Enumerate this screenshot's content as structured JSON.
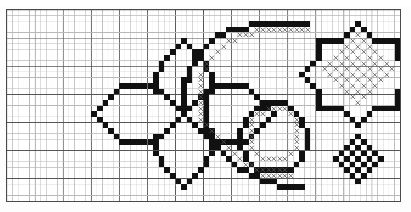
{
  "document": {
    "kind": "cross-stitch-pattern-chart",
    "title": "Cross-stitch pattern chart",
    "description": "Graph-paper needlework chart with three ornamental motifs"
  },
  "grid": {
    "origin_x": 6,
    "origin_y": 9,
    "cell_size": 5.62,
    "columns": 70,
    "rows": 34,
    "minor_line_color": "#b8b8b8",
    "major_line_color": "#555555",
    "major_every": 5,
    "border_color": "#4a4a4a",
    "background_color": "#ffffff"
  },
  "symbols": {
    "filled": {
      "name": "filled-square",
      "color": "#111111"
    },
    "cross": {
      "name": "cross-stitch-x",
      "color": "#555555"
    }
  },
  "motifs": [
    {
      "name": "four-petal-flower",
      "label": "Four petal flower motif",
      "filled": [
        [
          31,
          5
        ],
        [
          30,
          6
        ],
        [
          32,
          6
        ],
        [
          29,
          7
        ],
        [
          33,
          7
        ],
        [
          28,
          8
        ],
        [
          34,
          8
        ],
        [
          27,
          9
        ],
        [
          35,
          9
        ],
        [
          27,
          10
        ],
        [
          35,
          10
        ],
        [
          26,
          11
        ],
        [
          36,
          11
        ],
        [
          26,
          12
        ],
        [
          36,
          12
        ],
        [
          20,
          13
        ],
        [
          21,
          13
        ],
        [
          22,
          13
        ],
        [
          23,
          13
        ],
        [
          24,
          13
        ],
        [
          25,
          13
        ],
        [
          26,
          13
        ],
        [
          36,
          13
        ],
        [
          37,
          13
        ],
        [
          38,
          13
        ],
        [
          39,
          13
        ],
        [
          40,
          13
        ],
        [
          41,
          13
        ],
        [
          42,
          13
        ],
        [
          19,
          14
        ],
        [
          26,
          14
        ],
        [
          27,
          14
        ],
        [
          35,
          14
        ],
        [
          36,
          14
        ],
        [
          43,
          14
        ],
        [
          18,
          15
        ],
        [
          28,
          15
        ],
        [
          34,
          15
        ],
        [
          44,
          15
        ],
        [
          17,
          16
        ],
        [
          29,
          16
        ],
        [
          33,
          16
        ],
        [
          45,
          16
        ],
        [
          16,
          17
        ],
        [
          30,
          17
        ],
        [
          32,
          17
        ],
        [
          46,
          17
        ],
        [
          15,
          18
        ],
        [
          31,
          18
        ],
        [
          47,
          18
        ],
        [
          16,
          19
        ],
        [
          30,
          19
        ],
        [
          32,
          19
        ],
        [
          46,
          19
        ],
        [
          17,
          20
        ],
        [
          29,
          20
        ],
        [
          33,
          20
        ],
        [
          45,
          20
        ],
        [
          18,
          21
        ],
        [
          28,
          21
        ],
        [
          34,
          21
        ],
        [
          44,
          21
        ],
        [
          19,
          22
        ],
        [
          26,
          22
        ],
        [
          27,
          22
        ],
        [
          35,
          22
        ],
        [
          36,
          22
        ],
        [
          43,
          22
        ],
        [
          20,
          23
        ],
        [
          21,
          23
        ],
        [
          22,
          23
        ],
        [
          23,
          23
        ],
        [
          24,
          23
        ],
        [
          25,
          23
        ],
        [
          26,
          23
        ],
        [
          36,
          23
        ],
        [
          37,
          23
        ],
        [
          38,
          23
        ],
        [
          39,
          23
        ],
        [
          40,
          23
        ],
        [
          41,
          23
        ],
        [
          42,
          23
        ],
        [
          26,
          24
        ],
        [
          36,
          24
        ],
        [
          26,
          25
        ],
        [
          36,
          25
        ],
        [
          27,
          26
        ],
        [
          35,
          26
        ],
        [
          27,
          27
        ],
        [
          35,
          27
        ],
        [
          28,
          28
        ],
        [
          34,
          28
        ],
        [
          29,
          29
        ],
        [
          33,
          29
        ],
        [
          30,
          30
        ],
        [
          32,
          30
        ],
        [
          31,
          31
        ]
      ],
      "cross": []
    },
    {
      "name": "spiral-and-ring",
      "label": "Spiral with inner ring motif",
      "filled": [
        [
          43,
          2
        ],
        [
          44,
          2
        ],
        [
          45,
          2
        ],
        [
          46,
          2
        ],
        [
          47,
          2
        ],
        [
          48,
          2
        ],
        [
          49,
          2
        ],
        [
          50,
          2
        ],
        [
          51,
          2
        ],
        [
          52,
          2
        ],
        [
          53,
          2
        ],
        [
          39,
          3
        ],
        [
          40,
          3
        ],
        [
          41,
          3
        ],
        [
          42,
          3
        ],
        [
          37,
          4
        ],
        [
          38,
          4
        ],
        [
          36,
          5
        ],
        [
          35,
          6
        ],
        [
          34,
          7
        ],
        [
          33,
          8
        ],
        [
          33,
          9
        ],
        [
          32,
          10
        ],
        [
          32,
          11
        ],
        [
          31,
          12
        ],
        [
          32,
          12
        ],
        [
          31,
          13
        ],
        [
          31,
          14
        ],
        [
          35,
          14
        ],
        [
          31,
          15
        ],
        [
          35,
          15
        ],
        [
          31,
          16
        ],
        [
          35,
          16
        ],
        [
          46,
          16
        ],
        [
          47,
          16
        ],
        [
          48,
          16
        ],
        [
          49,
          16
        ],
        [
          31,
          17
        ],
        [
          35,
          17
        ],
        [
          44,
          17
        ],
        [
          45,
          17
        ],
        [
          50,
          17
        ],
        [
          31,
          18
        ],
        [
          35,
          18
        ],
        [
          43,
          18
        ],
        [
          51,
          18
        ],
        [
          35,
          19
        ],
        [
          42,
          19
        ],
        [
          52,
          19
        ],
        [
          35,
          20
        ],
        [
          42,
          20
        ],
        [
          52,
          20
        ],
        [
          35,
          21
        ],
        [
          41,
          21
        ],
        [
          53,
          21
        ],
        [
          36,
          21
        ],
        [
          41,
          22
        ],
        [
          53,
          22
        ],
        [
          37,
          23
        ],
        [
          41,
          23
        ],
        [
          53,
          23
        ],
        [
          37,
          24
        ],
        [
          41,
          24
        ],
        [
          53,
          24
        ],
        [
          38,
          25
        ],
        [
          42,
          25
        ],
        [
          52,
          25
        ],
        [
          39,
          26
        ],
        [
          42,
          26
        ],
        [
          52,
          26
        ],
        [
          40,
          27
        ],
        [
          43,
          27
        ],
        [
          51,
          27
        ],
        [
          41,
          28
        ],
        [
          44,
          28
        ],
        [
          45,
          28
        ],
        [
          50,
          28
        ],
        [
          42,
          28
        ],
        [
          46,
          28
        ],
        [
          47,
          28
        ],
        [
          48,
          28
        ],
        [
          49,
          28
        ],
        [
          43,
          29
        ],
        [
          44,
          29
        ],
        [
          45,
          30
        ],
        [
          46,
          30
        ],
        [
          47,
          30
        ],
        [
          48,
          31
        ],
        [
          49,
          31
        ],
        [
          50,
          31
        ],
        [
          51,
          31
        ],
        [
          52,
          31
        ]
      ],
      "cross": [
        [
          44,
          3
        ],
        [
          45,
          3
        ],
        [
          46,
          3
        ],
        [
          47,
          3
        ],
        [
          48,
          3
        ],
        [
          49,
          3
        ],
        [
          50,
          3
        ],
        [
          51,
          3
        ],
        [
          52,
          3
        ],
        [
          53,
          3
        ],
        [
          41,
          4
        ],
        [
          42,
          4
        ],
        [
          43,
          4
        ],
        [
          39,
          5
        ],
        [
          40,
          5
        ],
        [
          38,
          6
        ],
        [
          37,
          7
        ],
        [
          36,
          8
        ],
        [
          35,
          9
        ],
        [
          35,
          10
        ],
        [
          34,
          11
        ],
        [
          34,
          12
        ],
        [
          34,
          13
        ],
        [
          34,
          14
        ],
        [
          34,
          15
        ],
        [
          34,
          16
        ],
        [
          34,
          17
        ],
        [
          46,
          17
        ],
        [
          47,
          17
        ],
        [
          48,
          17
        ],
        [
          49,
          17
        ],
        [
          34,
          18
        ],
        [
          44,
          18
        ],
        [
          45,
          18
        ],
        [
          50,
          18
        ],
        [
          34,
          19
        ],
        [
          43,
          19
        ],
        [
          51,
          19
        ],
        [
          35,
          20
        ],
        [
          43,
          20
        ],
        [
          51,
          20
        ],
        [
          36,
          21
        ],
        [
          43,
          21
        ],
        [
          51,
          21
        ],
        [
          37,
          22
        ],
        [
          43,
          22
        ],
        [
          51,
          22
        ],
        [
          38,
          23
        ],
        [
          43,
          23
        ],
        [
          51,
          23
        ],
        [
          39,
          24
        ],
        [
          43,
          24
        ],
        [
          51,
          24
        ],
        [
          40,
          25
        ],
        [
          44,
          25
        ],
        [
          50,
          25
        ],
        [
          41,
          26
        ],
        [
          45,
          26
        ],
        [
          46,
          26
        ],
        [
          47,
          26
        ],
        [
          48,
          26
        ],
        [
          49,
          26
        ],
        [
          42,
          27
        ],
        [
          43,
          27
        ],
        [
          44,
          28
        ],
        [
          45,
          28
        ],
        [
          46,
          28
        ],
        [
          47,
          28
        ],
        [
          48,
          28
        ],
        [
          49,
          28
        ],
        [
          45,
          29
        ],
        [
          46,
          29
        ],
        [
          47,
          29
        ],
        [
          48,
          29
        ],
        [
          49,
          29
        ],
        [
          50,
          29
        ]
      ]
    },
    {
      "name": "octagon-star-lattice",
      "label": "Octagonal star with diamond lattice",
      "filled": [
        [
          62,
          2
        ],
        [
          61,
          3
        ],
        [
          63,
          3
        ],
        [
          60,
          4
        ],
        [
          64,
          4
        ],
        [
          55,
          5
        ],
        [
          56,
          5
        ],
        [
          57,
          5
        ],
        [
          58,
          5
        ],
        [
          59,
          5
        ],
        [
          65,
          5
        ],
        [
          66,
          5
        ],
        [
          67,
          5
        ],
        [
          68,
          5
        ],
        [
          69,
          5
        ],
        [
          55,
          6
        ],
        [
          69,
          6
        ],
        [
          55,
          7
        ],
        [
          69,
          7
        ],
        [
          55,
          8
        ],
        [
          69,
          8
        ],
        [
          54,
          9
        ],
        [
          70,
          9
        ],
        [
          53,
          10
        ],
        [
          71,
          10
        ],
        [
          52,
          11
        ],
        [
          72,
          11
        ],
        [
          53,
          12
        ],
        [
          71,
          12
        ],
        [
          54,
          13
        ],
        [
          70,
          13
        ],
        [
          55,
          14
        ],
        [
          69,
          14
        ],
        [
          55,
          15
        ],
        [
          69,
          15
        ],
        [
          55,
          16
        ],
        [
          69,
          16
        ],
        [
          55,
          17
        ],
        [
          56,
          17
        ],
        [
          57,
          17
        ],
        [
          58,
          17
        ],
        [
          59,
          17
        ],
        [
          65,
          17
        ],
        [
          66,
          17
        ],
        [
          67,
          17
        ],
        [
          68,
          17
        ],
        [
          69,
          17
        ],
        [
          60,
          18
        ],
        [
          64,
          18
        ],
        [
          61,
          19
        ],
        [
          63,
          19
        ],
        [
          62,
          20
        ]
      ],
      "cross": [
        [
          62,
          4
        ],
        [
          61,
          5
        ],
        [
          63,
          5
        ],
        [
          60,
          6
        ],
        [
          62,
          6
        ],
        [
          64,
          6
        ],
        [
          59,
          7
        ],
        [
          61,
          7
        ],
        [
          63,
          7
        ],
        [
          65,
          7
        ],
        [
          58,
          8
        ],
        [
          60,
          8
        ],
        [
          62,
          8
        ],
        [
          64,
          8
        ],
        [
          66,
          8
        ],
        [
          57,
          9
        ],
        [
          59,
          9
        ],
        [
          61,
          9
        ],
        [
          63,
          9
        ],
        [
          65,
          9
        ],
        [
          67,
          9
        ],
        [
          56,
          10
        ],
        [
          58,
          10
        ],
        [
          60,
          10
        ],
        [
          62,
          10
        ],
        [
          64,
          10
        ],
        [
          66,
          10
        ],
        [
          68,
          10
        ],
        [
          57,
          11
        ],
        [
          59,
          11
        ],
        [
          61,
          11
        ],
        [
          63,
          11
        ],
        [
          65,
          11
        ],
        [
          67,
          11
        ],
        [
          58,
          12
        ],
        [
          60,
          12
        ],
        [
          62,
          12
        ],
        [
          64,
          12
        ],
        [
          66,
          12
        ],
        [
          59,
          13
        ],
        [
          61,
          13
        ],
        [
          63,
          13
        ],
        [
          65,
          13
        ],
        [
          60,
          14
        ],
        [
          62,
          14
        ],
        [
          64,
          14
        ],
        [
          61,
          15
        ],
        [
          63,
          15
        ],
        [
          62,
          16
        ]
      ]
    },
    {
      "name": "checkerboard-diamond",
      "label": "Small checkerboard diamond motif",
      "filled": [
        [
          62,
          22
        ],
        [
          61,
          23
        ],
        [
          63,
          23
        ],
        [
          60,
          24
        ],
        [
          62,
          24
        ],
        [
          64,
          24
        ],
        [
          59,
          25
        ],
        [
          61,
          25
        ],
        [
          63,
          25
        ],
        [
          65,
          25
        ],
        [
          58,
          26
        ],
        [
          60,
          26
        ],
        [
          62,
          26
        ],
        [
          64,
          26
        ],
        [
          66,
          26
        ],
        [
          59,
          27
        ],
        [
          61,
          27
        ],
        [
          63,
          27
        ],
        [
          65,
          27
        ],
        [
          60,
          28
        ],
        [
          62,
          28
        ],
        [
          64,
          28
        ],
        [
          61,
          29
        ],
        [
          63,
          29
        ],
        [
          62,
          30
        ]
      ],
      "cross": []
    }
  ]
}
